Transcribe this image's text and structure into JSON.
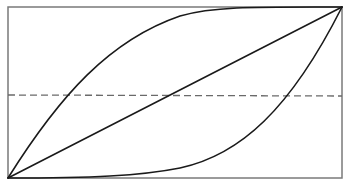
{
  "diagram": {
    "type": "curves-in-box",
    "frame": {
      "x": 8,
      "y": 7,
      "width": 334,
      "height": 171
    },
    "elements": [
      {
        "name": "diagonal-line",
        "kind": "straight",
        "from": [
          8,
          178
        ],
        "to": [
          342,
          7
        ]
      },
      {
        "name": "upper-concave-curve",
        "kind": "curve",
        "description": "bows toward top-left, starts at bottom-left corner and ends at top-right corner"
      },
      {
        "name": "lower-convex-curve",
        "kind": "curve",
        "description": "bows toward bottom-right, starts at bottom-left corner and ends at top-right corner"
      },
      {
        "name": "horizontal-dashed-line",
        "kind": "dashed",
        "y": 95
      }
    ],
    "caption": "",
    "colors": {
      "frame": "#7a7a7a",
      "curves": "#1a1a1a",
      "dashed": "#6a6a6a",
      "background": "#ffffff"
    }
  }
}
